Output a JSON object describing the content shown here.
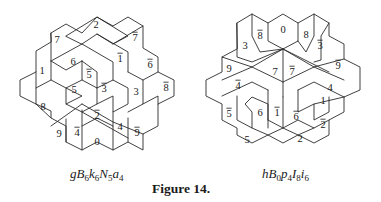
{
  "figure": {
    "caption": "Figure 14.",
    "tilings": [
      {
        "id": "left",
        "name_parts": [
          {
            "base": "gB",
            "sub": "6"
          },
          {
            "base": "k",
            "sub": "6"
          },
          {
            "base": "N",
            "sub": "5"
          },
          {
            "base": "a",
            "sub": "4"
          }
        ],
        "name_text": "gB6k6N5a4",
        "labels": [
          {
            "text": "2",
            "bar": false,
            "x": 96,
            "y": 26
          },
          {
            "text": "7",
            "bar": false,
            "x": 57,
            "y": 41
          },
          {
            "text": "7",
            "bar": true,
            "x": 135,
            "y": 39
          },
          {
            "text": "6",
            "bar": false,
            "x": 73,
            "y": 63
          },
          {
            "text": "1",
            "bar": true,
            "x": 120,
            "y": 60
          },
          {
            "text": "6",
            "bar": true,
            "x": 150,
            "y": 66
          },
          {
            "text": "1",
            "bar": false,
            "x": 42,
            "y": 72
          },
          {
            "text": "5",
            "bar": true,
            "x": 89,
            "y": 76
          },
          {
            "text": "5",
            "bar": false,
            "x": 74,
            "y": 91
          },
          {
            "text": "3",
            "bar": true,
            "x": 104,
            "y": 90
          },
          {
            "text": "3",
            "bar": false,
            "x": 136,
            "y": 93
          },
          {
            "text": "8",
            "bar": true,
            "x": 166,
            "y": 89
          },
          {
            "text": "8",
            "bar": false,
            "x": 43,
            "y": 108
          },
          {
            "text": "2",
            "bar": true,
            "x": 97,
            "y": 117
          },
          {
            "text": "4",
            "bar": true,
            "x": 77,
            "y": 134
          },
          {
            "text": "4",
            "bar": false,
            "x": 120,
            "y": 128
          },
          {
            "text": "9",
            "bar": true,
            "x": 137,
            "y": 134
          },
          {
            "text": "9",
            "bar": false,
            "x": 59,
            "y": 135
          },
          {
            "text": "0",
            "bar": false,
            "x": 97,
            "y": 143
          }
        ]
      },
      {
        "id": "right",
        "name_parts": [
          {
            "base": "hB",
            "sub": "0"
          },
          {
            "base": "p",
            "sub": "4"
          },
          {
            "base": "I",
            "sub": "8"
          },
          {
            "base": "i",
            "sub": "6"
          }
        ],
        "name_text": "hB0p4I8i6",
        "labels": [
          {
            "text": "0",
            "bar": false,
            "x": 283,
            "y": 31
          },
          {
            "text": "8",
            "bar": true,
            "x": 260,
            "y": 37
          },
          {
            "text": "8",
            "bar": false,
            "x": 306,
            "y": 36
          },
          {
            "text": "3",
            "bar": false,
            "x": 245,
            "y": 47
          },
          {
            "text": "3",
            "bar": true,
            "x": 320,
            "y": 47
          },
          {
            "text": "9",
            "bar": false,
            "x": 229,
            "y": 70
          },
          {
            "text": "9",
            "bar": true,
            "x": 338,
            "y": 67
          },
          {
            "text": "7",
            "bar": false,
            "x": 275,
            "y": 73
          },
          {
            "text": "7",
            "bar": true,
            "x": 292,
            "y": 73
          },
          {
            "text": "4",
            "bar": true,
            "x": 238,
            "y": 87
          },
          {
            "text": "4",
            "bar": false,
            "x": 330,
            "y": 89
          },
          {
            "text": "1",
            "bar": false,
            "x": 323,
            "y": 102
          },
          {
            "text": "5",
            "bar": true,
            "x": 229,
            "y": 115
          },
          {
            "text": "6",
            "bar": false,
            "x": 260,
            "y": 114
          },
          {
            "text": "1",
            "bar": true,
            "x": 277,
            "y": 114
          },
          {
            "text": "6",
            "bar": true,
            "x": 296,
            "y": 118
          },
          {
            "text": "2",
            "bar": true,
            "x": 323,
            "y": 126
          },
          {
            "text": "5",
            "bar": false,
            "x": 247,
            "y": 141
          },
          {
            "text": "2",
            "bar": false,
            "x": 300,
            "y": 140
          }
        ]
      }
    ]
  }
}
